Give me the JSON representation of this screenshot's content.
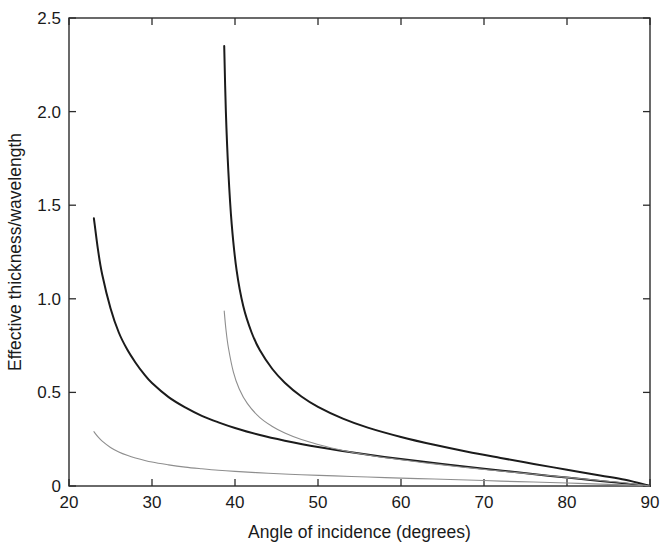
{
  "chart_data": {
    "type": "line",
    "title": "",
    "xlabel": "Angle of incidence (degrees)",
    "ylabel": "Effective thickness/wavelength",
    "xlim": [
      20,
      90
    ],
    "ylim": [
      0,
      2.5
    ],
    "xticks": [
      20,
      30,
      40,
      50,
      60,
      70,
      80,
      90
    ],
    "xtick_labels": [
      "20",
      "30",
      "40",
      "50",
      "60",
      "70",
      "80",
      "90"
    ],
    "yticks": [
      0,
      0.5,
      1.0,
      1.5,
      2.0,
      2.5
    ],
    "ytick_labels": [
      "0",
      "0.5",
      "1.0",
      "1.5",
      "2.0",
      "2.5"
    ],
    "grid": false,
    "legend": "none",
    "frame": "box",
    "ticks_all_sides": true,
    "series": [
      {
        "name": "curve-a-thick",
        "style": "solid-dark",
        "color": "#1b1b1b",
        "x": [
          23.0,
          23.5,
          24.0,
          25.0,
          26.0,
          27.0,
          28.0,
          29.0,
          30.0,
          32.0,
          34.0,
          36.0,
          38.0,
          40.0,
          43.0,
          46.0,
          50.0,
          54.0,
          58.0,
          62.0,
          66.0,
          70.0,
          74.0,
          78.0,
          82.0,
          86.0,
          90.0
        ],
        "y": [
          1.43,
          1.26,
          1.13,
          0.95,
          0.82,
          0.73,
          0.66,
          0.6,
          0.55,
          0.475,
          0.42,
          0.375,
          0.34,
          0.31,
          0.272,
          0.242,
          0.208,
          0.18,
          0.155,
          0.133,
          0.112,
          0.092,
          0.073,
          0.054,
          0.036,
          0.018,
          0.0
        ]
      },
      {
        "name": "curve-b-thin",
        "style": "solid-light",
        "color": "#8e8e8e",
        "x": [
          23.0,
          23.5,
          24.0,
          25.0,
          26.0,
          27.0,
          28.0,
          30.0,
          32.0,
          34.0,
          36.0,
          38.0,
          40.0,
          44.0,
          48.0,
          52.0,
          56.0,
          60.0,
          64.0,
          68.0,
          72.0,
          76.0,
          80.0,
          84.0,
          87.0,
          90.0
        ],
        "y": [
          0.29,
          0.262,
          0.24,
          0.206,
          0.182,
          0.164,
          0.15,
          0.128,
          0.113,
          0.101,
          0.092,
          0.084,
          0.078,
          0.068,
          0.06,
          0.054,
          0.048,
          0.042,
          0.037,
          0.032,
          0.026,
          0.021,
          0.016,
          0.01,
          0.006,
          0.0
        ]
      },
      {
        "name": "curve-c-thick",
        "style": "solid-dark",
        "color": "#1b1b1b",
        "x": [
          38.7,
          38.9,
          39.2,
          39.6,
          40.2,
          41.0,
          42.0,
          43.0,
          44.5,
          46.0,
          48.0,
          50.0,
          53.0,
          56.0,
          60.0,
          64.0,
          68.0,
          72.0,
          76.0,
          80.0,
          84.0,
          87.0,
          90.0
        ],
        "y": [
          2.35,
          2.0,
          1.68,
          1.4,
          1.15,
          0.96,
          0.82,
          0.725,
          0.625,
          0.552,
          0.478,
          0.423,
          0.36,
          0.312,
          0.262,
          0.22,
          0.183,
          0.15,
          0.118,
          0.087,
          0.056,
          0.033,
          0.0
        ]
      },
      {
        "name": "curve-d-thin",
        "style": "solid-light",
        "color": "#8e8e8e",
        "x": [
          38.7,
          38.9,
          39.2,
          39.8,
          40.5,
          41.5,
          43.0,
          44.5,
          46.0,
          48.0,
          50.0,
          53.0,
          56.0,
          60.0,
          64.0,
          68.0,
          72.0,
          76.0,
          80.0,
          84.0,
          87.0,
          90.0
        ],
        "y": [
          0.935,
          0.84,
          0.74,
          0.61,
          0.52,
          0.44,
          0.365,
          0.318,
          0.283,
          0.248,
          0.222,
          0.19,
          0.166,
          0.14,
          0.118,
          0.098,
          0.08,
          0.063,
          0.046,
          0.029,
          0.017,
          0.0
        ]
      }
    ]
  },
  "geometry": {
    "plot_left": 69,
    "plot_right": 650,
    "plot_top": 18,
    "plot_bottom": 486
  }
}
